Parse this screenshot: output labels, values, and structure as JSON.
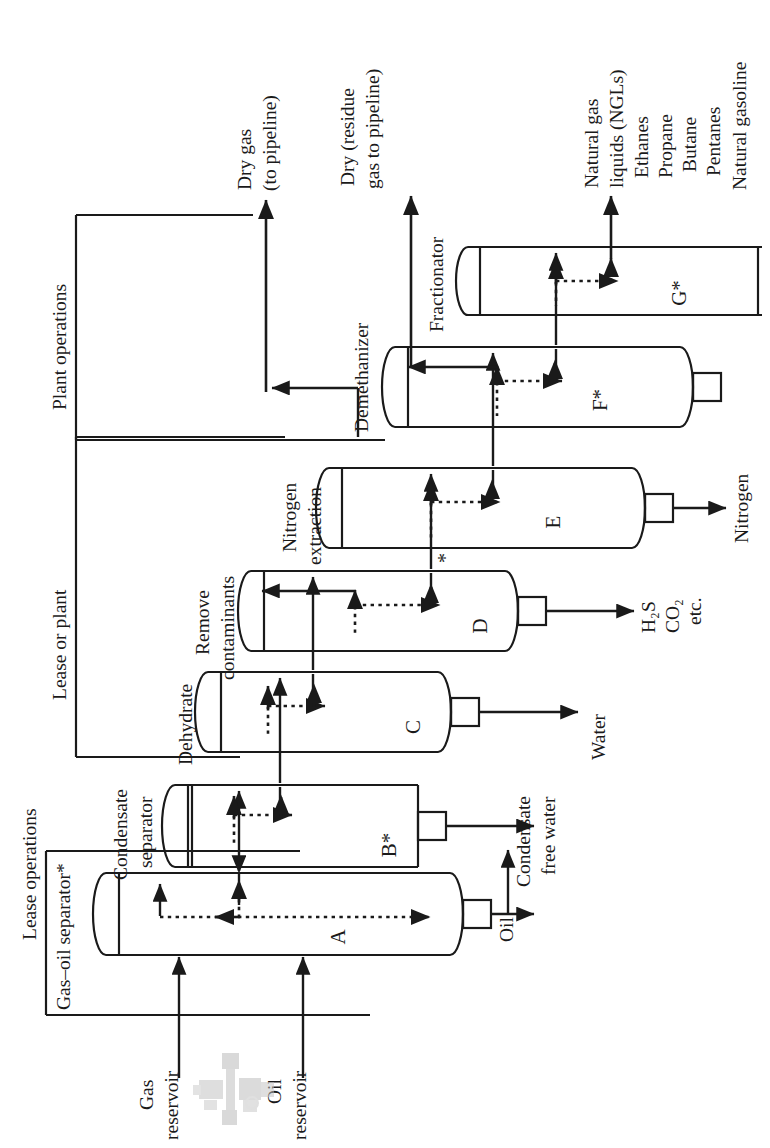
{
  "figure": {
    "kind": "process-flow-diagram",
    "orientation": "rotated 90 degrees counter-clockwise (read with head tilted right)",
    "ink_color": "#1a1a1a",
    "paper_color": "#ffffff"
  },
  "brackets": [
    {
      "id": "lease-operations",
      "label": "Lease operations"
    },
    {
      "id": "lease-or-plant",
      "label": "Lease or plant"
    },
    {
      "id": "plant-operations",
      "label": "Plant operations"
    }
  ],
  "sources": [
    {
      "id": "gas-reservoir",
      "label": "Gas\nreservoir",
      "line1": "Gas",
      "line2": "reservoir"
    },
    {
      "id": "oil-reservoir",
      "label": "Oil\nreservoir",
      "line1": "Oil",
      "line2": "reservoir"
    }
  ],
  "wellhead_icon": {
    "name": "wellhead-valve-icon",
    "tint": "#b9b9b9"
  },
  "stage_labels": [
    {
      "id": "gas-oil-separator",
      "text": "Gas–oil separator*"
    },
    {
      "id": "condensate-separator",
      "line1": "Condensate",
      "line2": "separator"
    },
    {
      "id": "dehydrate",
      "text": "Dehydrate"
    },
    {
      "id": "remove-contaminants",
      "line1": "Remove",
      "line2": "contaminants"
    },
    {
      "id": "nitrogen-extraction",
      "line1": "Nitrogen",
      "line2": "extraction"
    },
    {
      "id": "demethanizer",
      "text": "Demethanizer"
    },
    {
      "id": "fractionator",
      "text": "Fractionator"
    }
  ],
  "vessels": [
    {
      "id": "vessel-a",
      "tag": "A",
      "stage": "gas-oil-separator",
      "nozzle": true
    },
    {
      "id": "vessel-b",
      "tag": "B*",
      "stage": "condensate-separator",
      "nozzle": true
    },
    {
      "id": "vessel-c",
      "tag": "C",
      "stage": "dehydrate",
      "nozzle": true
    },
    {
      "id": "vessel-d",
      "tag": "D",
      "stage": "remove-contaminants",
      "nozzle": true
    },
    {
      "id": "vessel-e",
      "tag": "E",
      "stage": "nitrogen-extraction",
      "nozzle": true
    },
    {
      "id": "vessel-f",
      "tag": "F*",
      "stage": "demethanizer",
      "nozzle": true
    },
    {
      "id": "vessel-g",
      "tag": "G*",
      "stage": "fractionator",
      "nozzle": false
    }
  ],
  "asterisk_note": {
    "id": "inline-asterisk",
    "text": "*"
  },
  "side_outputs": [
    {
      "id": "output-oil",
      "from": "vessel-a",
      "lines": [
        "Oil"
      ]
    },
    {
      "id": "output-condensate",
      "from": "vessel-b",
      "lines": [
        "Condensate",
        "free water"
      ]
    },
    {
      "id": "output-water",
      "from": "vessel-c",
      "lines": [
        "Water"
      ]
    },
    {
      "id": "output-acid-gas",
      "from": "vessel-d",
      "lines": [
        "H₂S",
        "CO₂",
        "etc."
      ]
    },
    {
      "id": "output-nitrogen",
      "from": "vessel-e",
      "lines": [
        "Nitrogen"
      ]
    }
  ],
  "top_outputs": [
    {
      "id": "output-dry-gas",
      "line1": "Dry gas",
      "line2": "(to pipeline)"
    },
    {
      "id": "output-residue-gas",
      "line1": "Dry (residue",
      "line2": "gas to pipeline)"
    }
  ],
  "ngl_products": {
    "id": "output-ngl",
    "heading_line1": "Natural gas",
    "heading_line2": "liquids (NGLs)",
    "items": [
      "Ethanes",
      "Propane",
      "Butane",
      "Pentanes",
      "Natural gasoline"
    ]
  }
}
